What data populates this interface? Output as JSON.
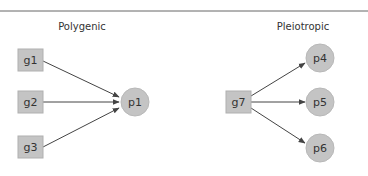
{
  "colors": {
    "node_fill": "#c4c4c4",
    "node_stroke": "#b0b0b0",
    "edge": "#444444",
    "rule": "#666666",
    "text": "#333333"
  },
  "panels": [
    {
      "title": "Polygenic",
      "genes": [
        "g1",
        "g2",
        "g3"
      ],
      "phenotypes": [
        "p1"
      ]
    },
    {
      "title": "Pleiotropic",
      "genes": [
        "g7"
      ],
      "phenotypes": [
        "p4",
        "p5",
        "p6"
      ]
    }
  ],
  "edges": [
    {
      "from": "g1",
      "to": "p1"
    },
    {
      "from": "g2",
      "to": "p1"
    },
    {
      "from": "g3",
      "to": "p1"
    },
    {
      "from": "g7",
      "to": "p4"
    },
    {
      "from": "g7",
      "to": "p5"
    },
    {
      "from": "g7",
      "to": "p6"
    }
  ]
}
